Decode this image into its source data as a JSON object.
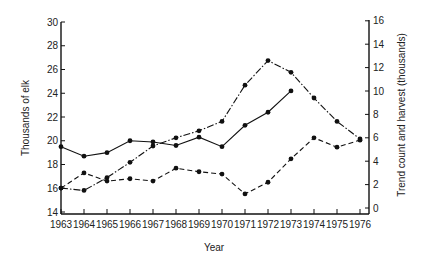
{
  "chart_data": {
    "type": "line",
    "title": "",
    "xlabel": "Year",
    "ylabel": "Thousands of elk",
    "ylabel_right": "Trend count and harvest (thousands)",
    "categories": [
      "1963",
      "1964",
      "1965",
      "1966",
      "1967",
      "1968",
      "1969",
      "1970",
      "1971",
      "1972",
      "1973",
      "1974",
      "1975",
      "1976"
    ],
    "ylim": [
      14,
      30
    ],
    "ylim_right": [
      0,
      16
    ],
    "yticks": [
      14,
      16,
      18,
      20,
      22,
      24,
      26,
      28,
      30
    ],
    "yticks_right": [
      0,
      2,
      4,
      6,
      8,
      10,
      12,
      14,
      16
    ],
    "grid": false,
    "legend": "none",
    "series": [
      {
        "name": "Thousands of elk",
        "axis": "left",
        "style": "solid",
        "values": [
          19.5,
          18.7,
          19.0,
          20.0,
          19.9,
          19.6,
          20.3,
          19.5,
          21.3,
          22.4,
          24.2,
          null,
          null,
          null
        ]
      },
      {
        "name": "Trend count",
        "axis": "right",
        "style": "dash-dot",
        "values": [
          1.7,
          1.5,
          2.6,
          3.9,
          5.3,
          6.0,
          6.6,
          7.4,
          10.5,
          12.6,
          11.6,
          9.4,
          7.4,
          5.9
        ]
      },
      {
        "name": "Harvest",
        "axis": "right",
        "style": "dashed",
        "values": [
          1.7,
          3.0,
          2.3,
          2.5,
          2.3,
          3.4,
          3.1,
          2.9,
          1.2,
          2.2,
          4.2,
          6.0,
          5.2,
          5.8
        ]
      }
    ]
  }
}
